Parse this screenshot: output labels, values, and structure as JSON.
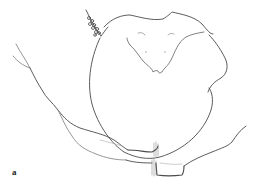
{
  "figure": {
    "panel_label": "a",
    "stroke_color": "#4a4a4a",
    "light_stroke_color": "#9a9a9a",
    "background": "#ffffff"
  }
}
